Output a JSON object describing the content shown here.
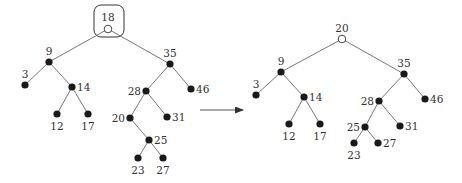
{
  "figure": {
    "arrow": {
      "x1": 200,
      "y1": 110,
      "x2": 243,
      "y2": 110
    }
  },
  "before_tree": {
    "highlight_box": {
      "x": 94,
      "y": 5,
      "w": 30,
      "h": 32,
      "r": 7
    },
    "nodes": [
      {
        "id": "18",
        "label": "18",
        "x": 108,
        "y": 29,
        "hollow": true,
        "lx": 108,
        "ly": 21,
        "anchor": "middle"
      },
      {
        "id": "9",
        "label": "9",
        "x": 49,
        "y": 62,
        "hollow": false,
        "lx": 49,
        "ly": 55,
        "anchor": "middle"
      },
      {
        "id": "35",
        "label": "35",
        "x": 170,
        "y": 64,
        "hollow": false,
        "lx": 170,
        "ly": 57,
        "anchor": "middle"
      },
      {
        "id": "3",
        "label": "3",
        "x": 25,
        "y": 85,
        "hollow": false,
        "lx": 25,
        "ly": 78,
        "anchor": "middle"
      },
      {
        "id": "14",
        "label": "14",
        "x": 72,
        "y": 87,
        "hollow": false,
        "lx": 77,
        "ly": 91,
        "anchor": "start"
      },
      {
        "id": "28",
        "label": "28",
        "x": 146,
        "y": 91,
        "hollow": false,
        "lx": 141,
        "ly": 95,
        "anchor": "end"
      },
      {
        "id": "46",
        "label": "46",
        "x": 191,
        "y": 89,
        "hollow": false,
        "lx": 196,
        "ly": 93,
        "anchor": "start"
      },
      {
        "id": "12",
        "label": "12",
        "x": 57,
        "y": 114,
        "hollow": false,
        "lx": 57,
        "ly": 130,
        "anchor": "middle"
      },
      {
        "id": "17",
        "label": "17",
        "x": 88,
        "y": 114,
        "hollow": false,
        "lx": 88,
        "ly": 130,
        "anchor": "middle"
      },
      {
        "id": "20",
        "label": "20",
        "x": 130,
        "y": 118,
        "hollow": false,
        "lx": 125,
        "ly": 122,
        "anchor": "end"
      },
      {
        "id": "31",
        "label": "31",
        "x": 167,
        "y": 117,
        "hollow": false,
        "lx": 172,
        "ly": 121,
        "anchor": "start"
      },
      {
        "id": "25",
        "label": "25",
        "x": 149,
        "y": 140,
        "hollow": false,
        "lx": 154,
        "ly": 144,
        "anchor": "start"
      },
      {
        "id": "23",
        "label": "23",
        "x": 138,
        "y": 158,
        "hollow": false,
        "lx": 138,
        "ly": 174,
        "anchor": "middle"
      },
      {
        "id": "27",
        "label": "27",
        "x": 163,
        "y": 158,
        "hollow": false,
        "lx": 163,
        "ly": 174,
        "anchor": "middle"
      }
    ],
    "edges": [
      [
        "18",
        "9"
      ],
      [
        "18",
        "35"
      ],
      [
        "9",
        "3"
      ],
      [
        "9",
        "14"
      ],
      [
        "14",
        "12"
      ],
      [
        "14",
        "17"
      ],
      [
        "35",
        "28"
      ],
      [
        "35",
        "46"
      ],
      [
        "28",
        "20"
      ],
      [
        "28",
        "31"
      ],
      [
        "20",
        "25"
      ],
      [
        "25",
        "23"
      ],
      [
        "25",
        "27"
      ]
    ]
  },
  "after_tree": {
    "nodes": [
      {
        "id": "20",
        "label": "20",
        "x": 342,
        "y": 39,
        "hollow": true,
        "lx": 342,
        "ly": 32,
        "anchor": "middle"
      },
      {
        "id": "9",
        "label": "9",
        "x": 281,
        "y": 72,
        "hollow": false,
        "lx": 281,
        "ly": 65,
        "anchor": "middle"
      },
      {
        "id": "35",
        "label": "35",
        "x": 404,
        "y": 74,
        "hollow": false,
        "lx": 404,
        "ly": 67,
        "anchor": "middle"
      },
      {
        "id": "3",
        "label": "3",
        "x": 256,
        "y": 95,
        "hollow": false,
        "lx": 256,
        "ly": 88,
        "anchor": "middle"
      },
      {
        "id": "14",
        "label": "14",
        "x": 304,
        "y": 97,
        "hollow": false,
        "lx": 309,
        "ly": 101,
        "anchor": "start"
      },
      {
        "id": "28",
        "label": "28",
        "x": 379,
        "y": 101,
        "hollow": false,
        "lx": 374,
        "ly": 105,
        "anchor": "end"
      },
      {
        "id": "46",
        "label": "46",
        "x": 425,
        "y": 99,
        "hollow": false,
        "lx": 430,
        "ly": 103,
        "anchor": "start"
      },
      {
        "id": "12",
        "label": "12",
        "x": 289,
        "y": 124,
        "hollow": false,
        "lx": 289,
        "ly": 140,
        "anchor": "middle"
      },
      {
        "id": "17",
        "label": "17",
        "x": 320,
        "y": 124,
        "hollow": false,
        "lx": 320,
        "ly": 140,
        "anchor": "middle"
      },
      {
        "id": "25",
        "label": "25",
        "x": 365,
        "y": 127,
        "hollow": false,
        "lx": 360,
        "ly": 131,
        "anchor": "end"
      },
      {
        "id": "31",
        "label": "31",
        "x": 400,
        "y": 126,
        "hollow": false,
        "lx": 405,
        "ly": 130,
        "anchor": "start"
      },
      {
        "id": "23",
        "label": "23",
        "x": 354,
        "y": 143,
        "hollow": false,
        "lx": 354,
        "ly": 159,
        "anchor": "middle"
      },
      {
        "id": "27",
        "label": "27",
        "x": 378,
        "y": 143,
        "hollow": false,
        "lx": 383,
        "ly": 147,
        "anchor": "start"
      }
    ],
    "edges": [
      [
        "20",
        "9"
      ],
      [
        "20",
        "35"
      ],
      [
        "9",
        "3"
      ],
      [
        "9",
        "14"
      ],
      [
        "14",
        "12"
      ],
      [
        "14",
        "17"
      ],
      [
        "35",
        "28"
      ],
      [
        "35",
        "46"
      ],
      [
        "28",
        "25"
      ],
      [
        "28",
        "31"
      ],
      [
        "25",
        "23"
      ],
      [
        "25",
        "27"
      ]
    ]
  }
}
